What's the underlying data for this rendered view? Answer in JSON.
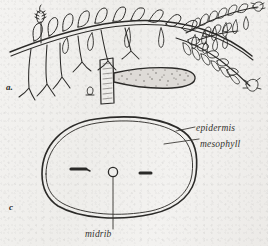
{
  "figure": {
    "panels": [
      {
        "id": "a",
        "label": "a.",
        "caption_text": "a."
      },
      {
        "id": "b",
        "label": "b",
        "caption_text": "b"
      },
      {
        "id": "c",
        "label": "c",
        "caption_text": "c"
      }
    ],
    "annotations": {
      "epidermis": "epidermis",
      "mesophyll": "mesophyll",
      "midrib": "midrib"
    },
    "colors": {
      "paper": "#f2f1ef",
      "ink": "#2b2a28",
      "ink_light": "#4a4845",
      "stipple": "#6a6764"
    },
    "icons": {
      "plant": "creeping-plant-habit-icon",
      "strobilus": "strobilus-icon",
      "sporophyll": "sporophyll-detail-icon",
      "leaf_section": "leaf-cross-section-icon"
    }
  }
}
